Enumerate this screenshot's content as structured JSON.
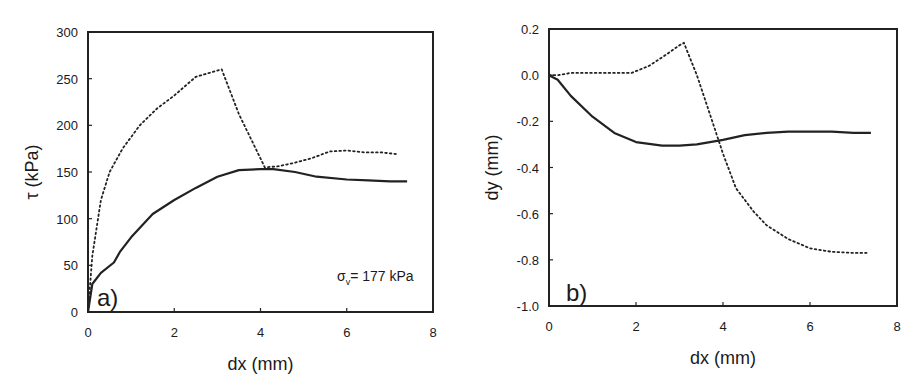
{
  "chart_data": [
    {
      "type": "line",
      "panel_label": "a)",
      "title": "",
      "xlabel": "dx (mm)",
      "ylabel": "τ (kPa)",
      "xlim": [
        0,
        8
      ],
      "ylim": [
        0,
        300
      ],
      "xticks": [
        "0",
        "2",
        "4",
        "6",
        "8"
      ],
      "yticks": [
        "0",
        "50",
        "100",
        "150",
        "200",
        "250",
        "300"
      ],
      "grid": false,
      "legend": "none",
      "annotation": "σv= 177 kPa",
      "series": [
        {
          "name": "solid",
          "style": "solid",
          "x": [
            0,
            0.1,
            0.3,
            0.6,
            0.75,
            1.0,
            1.3,
            1.5,
            2.0,
            2.5,
            3.0,
            3.5,
            4.0,
            4.3,
            4.8,
            5.3,
            6.0,
            6.5,
            7.0,
            7.4
          ],
          "y": [
            0,
            30,
            42,
            53,
            65,
            80,
            95,
            105,
            120,
            133,
            145,
            152,
            153,
            153,
            150,
            145,
            142,
            141,
            140,
            140
          ]
        },
        {
          "name": "dotted",
          "style": "dotted",
          "x": [
            0,
            0.1,
            0.3,
            0.5,
            0.8,
            1.2,
            1.6,
            2.0,
            2.5,
            2.8,
            3.1,
            3.5,
            4.1,
            4.4,
            4.8,
            5.2,
            5.6,
            6.0,
            6.4,
            6.8,
            7.2
          ],
          "y": [
            0,
            60,
            120,
            150,
            175,
            200,
            218,
            232,
            252,
            256,
            260,
            212,
            155,
            156,
            160,
            165,
            172,
            173,
            171,
            171,
            169
          ]
        }
      ]
    },
    {
      "type": "line",
      "panel_label": "b)",
      "title": "",
      "xlabel": "dx (mm)",
      "ylabel": "dy (mm)",
      "xlim": [
        0,
        8
      ],
      "ylim": [
        -1.0,
        0.2
      ],
      "xticks": [
        "0",
        "2",
        "4",
        "6",
        "8"
      ],
      "yticks": [
        "0.2",
        "0.0",
        "-0.2",
        "-0.4",
        "-0.6",
        "-0.8",
        "-1.0"
      ],
      "grid": false,
      "legend": "none",
      "series": [
        {
          "name": "solid",
          "style": "solid",
          "x": [
            0,
            0.2,
            0.5,
            1.0,
            1.5,
            2.0,
            2.6,
            3.0,
            3.4,
            4.0,
            4.5,
            5.0,
            5.5,
            6.0,
            6.5,
            7.0,
            7.4
          ],
          "y": [
            0,
            -0.02,
            -0.09,
            -0.18,
            -0.25,
            -0.29,
            -0.305,
            -0.305,
            -0.3,
            -0.28,
            -0.26,
            -0.25,
            -0.245,
            -0.245,
            -0.245,
            -0.25,
            -0.25
          ]
        },
        {
          "name": "dotted",
          "style": "dotted",
          "x": [
            0,
            0.2,
            0.5,
            1.0,
            1.5,
            1.9,
            2.3,
            2.7,
            3.0,
            3.1,
            3.4,
            3.7,
            4.0,
            4.3,
            4.7,
            5.0,
            5.5,
            6.0,
            6.5,
            7.0,
            7.3
          ],
          "y": [
            0,
            0.0,
            0.01,
            0.01,
            0.01,
            0.01,
            0.04,
            0.09,
            0.13,
            0.14,
            0.0,
            -0.17,
            -0.34,
            -0.49,
            -0.59,
            -0.65,
            -0.71,
            -0.75,
            -0.765,
            -0.77,
            -0.77
          ]
        }
      ]
    }
  ]
}
